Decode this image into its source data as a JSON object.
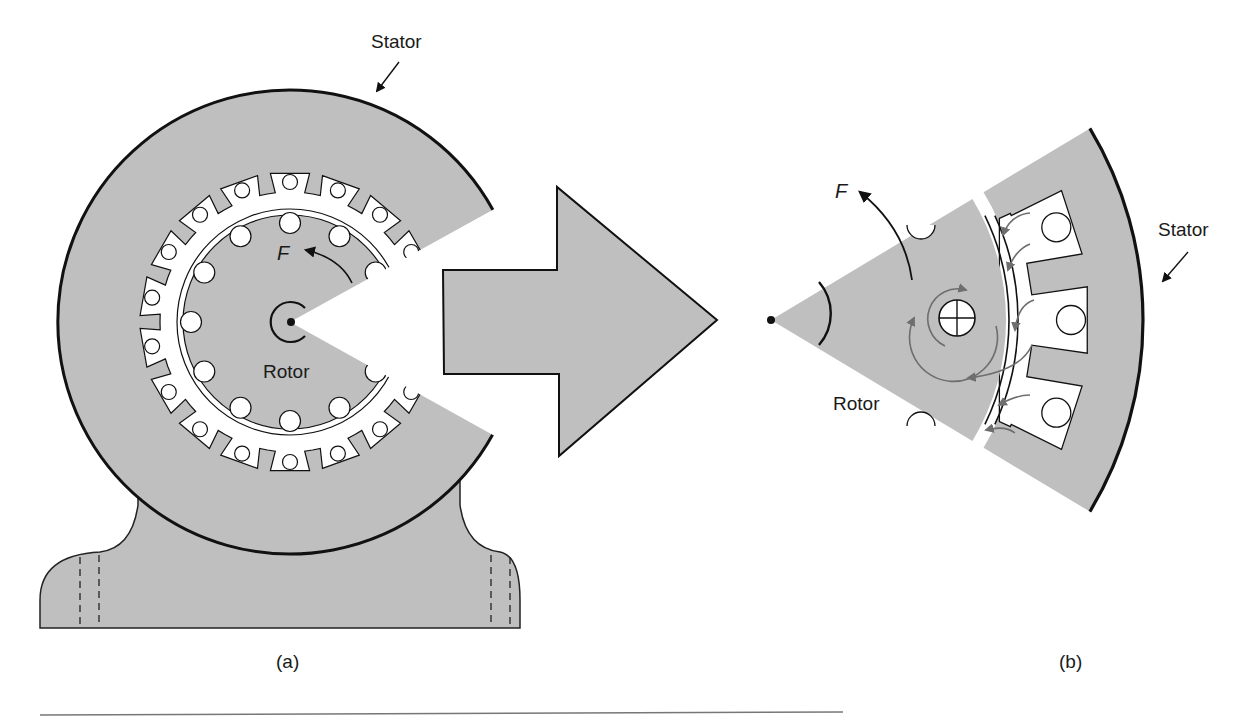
{
  "figure": {
    "panel_a": {
      "caption": "(a)",
      "stator_label": "Stator",
      "rotor_label": "Rotor",
      "force_label": "F"
    },
    "panel_b": {
      "caption": "(b)",
      "stator_label": "Stator",
      "rotor_label": "Rotor",
      "force_label": "F"
    }
  },
  "colors": {
    "fill_gray": "#bfbfbf",
    "stroke": "#111111",
    "flux_arrow": "#6e6e6e",
    "background": "#ffffff"
  }
}
